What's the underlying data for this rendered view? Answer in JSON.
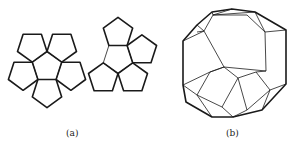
{
  "figure": {
    "panel_a": {
      "label": "(a)",
      "description": "Net of a regular dodecahedron: two flowers of six pentagons each",
      "flowers": [
        {
          "center": [
            47,
            67
          ],
          "radius": 15.5,
          "rotation_deg": 90,
          "skip_edge": 1
        },
        {
          "center": [
            118,
            58
          ],
          "radius": 15.5,
          "rotation_deg": -90,
          "skip_edge": 3
        }
      ]
    },
    "panel_b": {
      "label": "(b)",
      "description": "Perspective line drawing of a regular dodecahedron"
    },
    "colors": {
      "stroke": "#1a1a1a",
      "background": "#ffffff"
    }
  }
}
